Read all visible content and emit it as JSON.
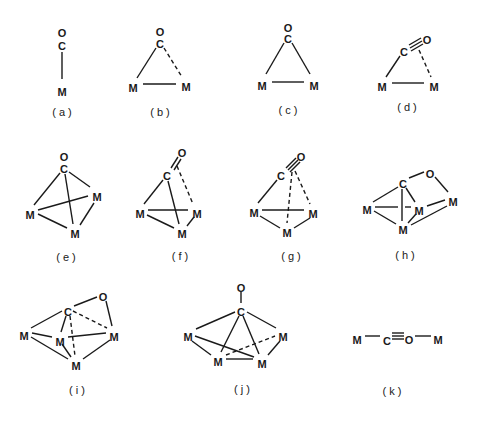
{
  "figure": {
    "width": 483,
    "height": 421,
    "ink_color": "#1a1a1a",
    "background": "#ffffff",
    "structures": [
      {
        "id": "a",
        "label": "( a )",
        "label_pos": [
          62,
          116
        ],
        "atoms": [
          {
            "t": "O",
            "x": 62,
            "y": 33
          },
          {
            "t": "C",
            "x": 62,
            "y": 46
          },
          {
            "t": "M",
            "x": 62,
            "y": 92
          }
        ],
        "bonds": [
          {
            "x1": 62,
            "y1": 52,
            "x2": 62,
            "y2": 79,
            "style": "solid"
          }
        ]
      },
      {
        "id": "b",
        "label": "( b )",
        "label_pos": [
          160,
          116
        ],
        "atoms": [
          {
            "t": "O",
            "x": 160,
            "y": 32
          },
          {
            "t": "C",
            "x": 160,
            "y": 44
          },
          {
            "t": "M",
            "x": 133,
            "y": 88
          },
          {
            "t": "M",
            "x": 186,
            "y": 87
          }
        ],
        "bonds": [
          {
            "x1": 156,
            "y1": 48,
            "x2": 137,
            "y2": 78,
            "style": "solid"
          },
          {
            "x1": 164,
            "y1": 48,
            "x2": 182,
            "y2": 77,
            "style": "dashed"
          },
          {
            "x1": 143,
            "y1": 84,
            "x2": 176,
            "y2": 84,
            "style": "solid"
          }
        ]
      },
      {
        "id": "c",
        "label": "( c )",
        "label_pos": [
          288,
          114
        ],
        "atoms": [
          {
            "t": "O",
            "x": 288,
            "y": 28
          },
          {
            "t": "C",
            "x": 288,
            "y": 39
          },
          {
            "t": "M",
            "x": 262,
            "y": 86
          },
          {
            "t": "M",
            "x": 314,
            "y": 86
          }
        ],
        "bonds": [
          {
            "x1": 284,
            "y1": 43,
            "x2": 266,
            "y2": 74,
            "style": "solid"
          },
          {
            "x1": 292,
            "y1": 43,
            "x2": 310,
            "y2": 74,
            "style": "solid"
          },
          {
            "x1": 272,
            "y1": 82,
            "x2": 304,
            "y2": 82,
            "style": "solid"
          }
        ]
      },
      {
        "id": "d",
        "label": "( d )",
        "label_pos": [
          407,
          111
        ],
        "atoms": [
          {
            "t": "C",
            "x": 404,
            "y": 52
          },
          {
            "t": "O",
            "x": 427,
            "y": 40
          },
          {
            "t": "M",
            "x": 382,
            "y": 87
          },
          {
            "t": "M",
            "x": 434,
            "y": 87
          }
        ],
        "bonds": [
          {
            "x1": 400,
            "y1": 56,
            "x2": 386,
            "y2": 77,
            "style": "solid"
          },
          {
            "x1": 409,
            "y1": 45,
            "x2": 421,
            "y2": 38,
            "style": "solid"
          },
          {
            "x1": 410,
            "y1": 48,
            "x2": 422,
            "y2": 41,
            "style": "solid"
          },
          {
            "x1": 411,
            "y1": 51,
            "x2": 423,
            "y2": 44,
            "style": "solid"
          },
          {
            "x1": 419,
            "y1": 50,
            "x2": 431,
            "y2": 77,
            "style": "dashed"
          },
          {
            "x1": 392,
            "y1": 83,
            "x2": 424,
            "y2": 83,
            "style": "solid"
          }
        ]
      },
      {
        "id": "e",
        "label": "( e )",
        "label_pos": [
          66,
          261
        ],
        "atoms": [
          {
            "t": "O",
            "x": 64,
            "y": 157
          },
          {
            "t": "C",
            "x": 64,
            "y": 169
          },
          {
            "t": "M",
            "x": 30,
            "y": 215
          },
          {
            "t": "M",
            "x": 97,
            "y": 197
          },
          {
            "t": "M",
            "x": 75,
            "y": 234
          }
        ],
        "bonds": [
          {
            "x1": 60,
            "y1": 173,
            "x2": 34,
            "y2": 205,
            "style": "solid"
          },
          {
            "x1": 69,
            "y1": 172,
            "x2": 90,
            "y2": 187,
            "style": "solid"
          },
          {
            "x1": 65,
            "y1": 174,
            "x2": 73,
            "y2": 224,
            "style": "solid"
          },
          {
            "x1": 38,
            "y1": 210,
            "x2": 88,
            "y2": 196,
            "style": "solid"
          },
          {
            "x1": 38,
            "y1": 214,
            "x2": 67,
            "y2": 228,
            "style": "solid"
          },
          {
            "x1": 94,
            "y1": 203,
            "x2": 80,
            "y2": 225,
            "style": "solid"
          }
        ]
      },
      {
        "id": "f",
        "label": "( f )",
        "label_pos": [
          180,
          260
        ],
        "atoms": [
          {
            "t": "O",
            "x": 182,
            "y": 153
          },
          {
            "t": "C",
            "x": 167,
            "y": 176
          },
          {
            "t": "M",
            "x": 140,
            "y": 214
          },
          {
            "t": "M",
            "x": 197,
            "y": 214
          },
          {
            "t": "M",
            "x": 182,
            "y": 234
          }
        ],
        "bonds": [
          {
            "x1": 171,
            "y1": 168,
            "x2": 178,
            "y2": 157,
            "style": "solid"
          },
          {
            "x1": 174,
            "y1": 170,
            "x2": 181,
            "y2": 159,
            "style": "solid"
          },
          {
            "x1": 163,
            "y1": 180,
            "x2": 144,
            "y2": 204,
            "style": "solid"
          },
          {
            "x1": 168,
            "y1": 181,
            "x2": 179,
            "y2": 224,
            "style": "solid"
          },
          {
            "x1": 177,
            "y1": 166,
            "x2": 193,
            "y2": 204,
            "style": "dashed"
          },
          {
            "x1": 148,
            "y1": 210,
            "x2": 188,
            "y2": 210,
            "style": "solid"
          },
          {
            "x1": 147,
            "y1": 215,
            "x2": 174,
            "y2": 228,
            "style": "solid"
          },
          {
            "x1": 194,
            "y1": 217,
            "x2": 187,
            "y2": 226,
            "style": "solid"
          }
        ]
      },
      {
        "id": "g",
        "label": "( g )",
        "label_pos": [
          291,
          260
        ],
        "atoms": [
          {
            "t": "O",
            "x": 301,
            "y": 157
          },
          {
            "t": "C",
            "x": 281,
            "y": 176
          },
          {
            "t": "M",
            "x": 254,
            "y": 213
          },
          {
            "t": "M",
            "x": 313,
            "y": 214
          },
          {
            "t": "M",
            "x": 287,
            "y": 233
          }
        ],
        "bonds": [
          {
            "x1": 286,
            "y1": 168,
            "x2": 296,
            "y2": 158,
            "style": "solid"
          },
          {
            "x1": 288,
            "y1": 170,
            "x2": 298,
            "y2": 160,
            "style": "solid"
          },
          {
            "x1": 290,
            "y1": 172,
            "x2": 300,
            "y2": 162,
            "style": "solid"
          },
          {
            "x1": 277,
            "y1": 180,
            "x2": 258,
            "y2": 203,
            "style": "solid"
          },
          {
            "x1": 292,
            "y1": 172,
            "x2": 287,
            "y2": 223,
            "style": "dashed"
          },
          {
            "x1": 295,
            "y1": 171,
            "x2": 310,
            "y2": 204,
            "style": "dashed"
          },
          {
            "x1": 262,
            "y1": 210,
            "x2": 304,
            "y2": 210,
            "style": "solid"
          },
          {
            "x1": 260,
            "y1": 216,
            "x2": 280,
            "y2": 228,
            "style": "solid"
          },
          {
            "x1": 310,
            "y1": 218,
            "x2": 294,
            "y2": 228,
            "style": "solid"
          }
        ]
      },
      {
        "id": "h",
        "label": "( h )",
        "label_pos": [
          405,
          259
        ],
        "atoms": [
          {
            "t": "C",
            "x": 403,
            "y": 184
          },
          {
            "t": "O",
            "x": 430,
            "y": 174
          },
          {
            "t": "M",
            "x": 367,
            "y": 210
          },
          {
            "t": "M",
            "x": 419,
            "y": 211
          },
          {
            "t": "M",
            "x": 453,
            "y": 202
          },
          {
            "t": "M",
            "x": 403,
            "y": 230
          }
        ],
        "bonds": [
          {
            "x1": 409,
            "y1": 178,
            "x2": 424,
            "y2": 172,
            "style": "solid"
          },
          {
            "x1": 435,
            "y1": 177,
            "x2": 448,
            "y2": 192,
            "style": "solid"
          },
          {
            "x1": 398,
            "y1": 187,
            "x2": 373,
            "y2": 202,
            "style": "solid"
          },
          {
            "x1": 406,
            "y1": 188,
            "x2": 415,
            "y2": 202,
            "style": "solid"
          },
          {
            "x1": 402,
            "y1": 189,
            "x2": 402,
            "y2": 221,
            "style": "solid"
          },
          {
            "x1": 375,
            "y1": 207,
            "x2": 398,
            "y2": 207,
            "style": "solid"
          },
          {
            "x1": 405,
            "y1": 207,
            "x2": 411,
            "y2": 207,
            "style": "solid"
          },
          {
            "x1": 374,
            "y1": 211,
            "x2": 396,
            "y2": 224,
            "style": "solid"
          },
          {
            "x1": 416,
            "y1": 214,
            "x2": 408,
            "y2": 223,
            "style": "solid"
          },
          {
            "x1": 427,
            "y1": 206,
            "x2": 445,
            "y2": 200,
            "style": "solid"
          },
          {
            "x1": 411,
            "y1": 225,
            "x2": 447,
            "y2": 206,
            "style": "solid"
          }
        ]
      },
      {
        "id": "i",
        "label": "( i )",
        "label_pos": [
          77,
          394
        ],
        "atoms": [
          {
            "t": "C",
            "x": 68,
            "y": 312
          },
          {
            "t": "O",
            "x": 103,
            "y": 297
          },
          {
            "t": "M",
            "x": 24,
            "y": 336
          },
          {
            "t": "M",
            "x": 60,
            "y": 342
          },
          {
            "t": "M",
            "x": 114,
            "y": 337
          },
          {
            "t": "M",
            "x": 76,
            "y": 366
          }
        ],
        "bonds": [
          {
            "x1": 74,
            "y1": 306,
            "x2": 97,
            "y2": 297,
            "style": "solid"
          },
          {
            "x1": 106,
            "y1": 301,
            "x2": 112,
            "y2": 326,
            "style": "solid"
          },
          {
            "x1": 62,
            "y1": 311,
            "x2": 31,
            "y2": 328,
            "style": "solid"
          },
          {
            "x1": 66,
            "y1": 316,
            "x2": 61,
            "y2": 332,
            "style": "solid"
          },
          {
            "x1": 73,
            "y1": 311,
            "x2": 107,
            "y2": 328,
            "style": "dashed"
          },
          {
            "x1": 70,
            "y1": 316,
            "x2": 75,
            "y2": 356,
            "style": "dashed"
          },
          {
            "x1": 32,
            "y1": 333,
            "x2": 52,
            "y2": 337,
            "style": "solid"
          },
          {
            "x1": 68,
            "y1": 337,
            "x2": 106,
            "y2": 333,
            "style": "solid"
          },
          {
            "x1": 31,
            "y1": 337,
            "x2": 68,
            "y2": 359,
            "style": "solid"
          },
          {
            "x1": 62,
            "y1": 344,
            "x2": 71,
            "y2": 357,
            "style": "solid"
          },
          {
            "x1": 110,
            "y1": 340,
            "x2": 83,
            "y2": 359,
            "style": "solid"
          }
        ]
      },
      {
        "id": "j",
        "label": "( j )",
        "label_pos": [
          242,
          393
        ],
        "atoms": [
          {
            "t": "O",
            "x": 241,
            "y": 288
          },
          {
            "t": "C",
            "x": 241,
            "y": 312
          },
          {
            "t": "M",
            "x": 188,
            "y": 337
          },
          {
            "t": "M",
            "x": 283,
            "y": 337
          },
          {
            "t": "M",
            "x": 218,
            "y": 362
          },
          {
            "t": "M",
            "x": 262,
            "y": 364
          }
        ],
        "bonds": [
          {
            "x1": 241,
            "y1": 292,
            "x2": 241,
            "y2": 303,
            "style": "solid"
          },
          {
            "x1": 235,
            "y1": 312,
            "x2": 196,
            "y2": 329,
            "style": "solid"
          },
          {
            "x1": 247,
            "y1": 312,
            "x2": 276,
            "y2": 328,
            "style": "solid"
          },
          {
            "x1": 239,
            "y1": 316,
            "x2": 221,
            "y2": 352,
            "style": "solid"
          },
          {
            "x1": 243,
            "y1": 316,
            "x2": 259,
            "y2": 354,
            "style": "solid"
          },
          {
            "x1": 195,
            "y1": 336,
            "x2": 254,
            "y2": 357,
            "style": "solid"
          },
          {
            "x1": 192,
            "y1": 341,
            "x2": 211,
            "y2": 355,
            "style": "solid"
          },
          {
            "x1": 226,
            "y1": 355,
            "x2": 275,
            "y2": 336,
            "style": "dashed"
          },
          {
            "x1": 226,
            "y1": 359,
            "x2": 253,
            "y2": 359,
            "style": "solid"
          },
          {
            "x1": 280,
            "y1": 341,
            "x2": 268,
            "y2": 355,
            "style": "solid"
          }
        ]
      },
      {
        "id": "k",
        "label": "( k )",
        "label_pos": [
          392,
          395
        ],
        "atoms": [
          {
            "t": "M",
            "x": 357,
            "y": 340
          },
          {
            "t": "C",
            "x": 387,
            "y": 341
          },
          {
            "t": "O",
            "x": 409,
            "y": 340
          },
          {
            "t": "M",
            "x": 438,
            "y": 340
          }
        ],
        "bonds": [
          {
            "x1": 365,
            "y1": 336,
            "x2": 380,
            "y2": 336,
            "style": "solid"
          },
          {
            "x1": 392,
            "y1": 333,
            "x2": 404,
            "y2": 333,
            "style": "solid"
          },
          {
            "x1": 392,
            "y1": 336,
            "x2": 404,
            "y2": 336,
            "style": "solid"
          },
          {
            "x1": 392,
            "y1": 339,
            "x2": 404,
            "y2": 339,
            "style": "solid"
          },
          {
            "x1": 415,
            "y1": 336,
            "x2": 431,
            "y2": 336,
            "style": "solid"
          }
        ]
      }
    ]
  }
}
